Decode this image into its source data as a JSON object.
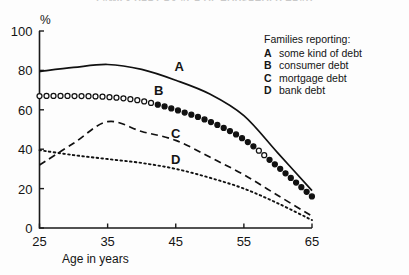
{
  "figure": {
    "cut_off_title": "FAMILY DEBT BY AGE OF HOUSEHOLD HEAD",
    "y_unit_label": "%",
    "x_axis_title": "Age in years"
  },
  "legend": {
    "title": "Families reporting:",
    "entries": [
      {
        "key": "A",
        "label": "some kind of debt"
      },
      {
        "key": "B",
        "label": "consumer debt"
      },
      {
        "key": "C",
        "label": "mortgage debt"
      },
      {
        "key": "D",
        "label": "bank debt"
      }
    ]
  },
  "curve_labels": [
    {
      "key": "A",
      "x": 45.5,
      "y": 79.5
    },
    {
      "key": "B",
      "x": 42.5,
      "y": 67.5
    },
    {
      "key": "C",
      "x": 45.0,
      "y": 45.5
    },
    {
      "key": "D",
      "x": 45.0,
      "y": 32.5
    }
  ],
  "chart_data": {
    "type": "line",
    "title": "FAMILY DEBT BY AGE OF HOUSEHOLD HEAD",
    "xlabel": "Age in years",
    "ylabel": "%",
    "xlim": [
      25,
      65
    ],
    "ylim": [
      0,
      100
    ],
    "xticks": [
      25,
      35,
      45,
      55,
      65
    ],
    "yticks": [
      0,
      20,
      40,
      60,
      80,
      100
    ],
    "grid": false,
    "legend_position": "top-right",
    "x": [
      25,
      30,
      35,
      40,
      45,
      50,
      55,
      60,
      65
    ],
    "series": [
      {
        "name": "A",
        "label": "some kind of debt",
        "style": "solid",
        "values": [
          79.5,
          81.5,
          83.0,
          80.5,
          75.0,
          68.0,
          57.0,
          38.0,
          19.0
        ]
      },
      {
        "name": "B",
        "label": "consumer debt",
        "style": "circle-markers",
        "values": [
          67.0,
          67.0,
          66.5,
          64.5,
          60.0,
          54.0,
          45.0,
          31.0,
          16.0
        ]
      },
      {
        "name": "C",
        "label": "mortgage debt",
        "style": "dashed",
        "values": [
          32.0,
          43.0,
          54.0,
          49.0,
          44.5,
          36.0,
          27.0,
          16.5,
          6.0
        ]
      },
      {
        "name": "D",
        "label": "bank debt",
        "style": "dotted",
        "values": [
          39.5,
          37.0,
          35.0,
          33.0,
          30.0,
          25.5,
          20.0,
          12.5,
          4.0
        ]
      }
    ]
  }
}
